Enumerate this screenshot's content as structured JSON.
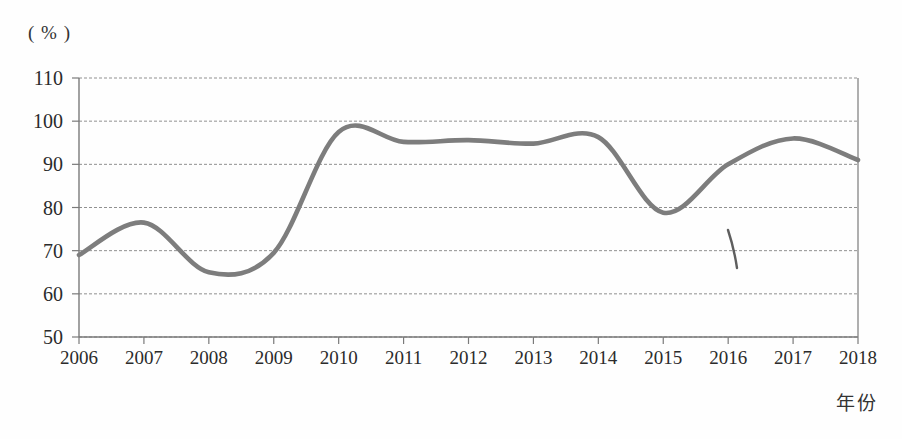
{
  "figure": {
    "unit_label": "( % )",
    "x_axis_title": "年份",
    "background_color": "#fefefe"
  },
  "style": {
    "line_color": "#7d7d7d",
    "grid_color": "#909090",
    "axis_color": "#7a7a7a",
    "text_color": "#2b2b2b"
  },
  "annotations": [
    {
      "name": "pen-stroke-mark",
      "x": 733,
      "y": 248
    }
  ],
  "chart_data": {
    "type": "line",
    "title": "",
    "xlabel": "年份",
    "ylabel": "( % )",
    "categories": [
      "2006",
      "2007",
      "2008",
      "2009",
      "2010",
      "2011",
      "2012",
      "2013",
      "2014",
      "2015",
      "2016",
      "2017",
      "2018"
    ],
    "x": [
      2006,
      2007,
      2008,
      2009,
      2010,
      2011,
      2012,
      2013,
      2014,
      2015,
      2016,
      2017,
      2018
    ],
    "values": [
      69,
      76.5,
      65,
      69.5,
      97.5,
      95.2,
      95.6,
      94.8,
      96.3,
      78.8,
      90,
      96,
      91
    ],
    "series": [
      {
        "name": "比率",
        "values": [
          69,
          76.5,
          65,
          69.5,
          97.5,
          95.2,
          95.6,
          94.8,
          96.3,
          78.8,
          90,
          96,
          91
        ]
      }
    ],
    "ylim": [
      50,
      110
    ],
    "xlim": [
      2006,
      2018
    ],
    "yticks": [
      50,
      60,
      70,
      80,
      90,
      100,
      110
    ],
    "ytick_labels": [
      "50",
      "60",
      "70",
      "80",
      "90",
      "100",
      "110"
    ],
    "xtick_labels": [
      "2006",
      "2007",
      "2008",
      "2009",
      "2010",
      "2011",
      "2012",
      "2013",
      "2014",
      "2015",
      "2016",
      "2017",
      "2018"
    ],
    "grid": true,
    "grid_style": "dashed",
    "legend": false,
    "legend_position": "none",
    "smoothing": "spline"
  },
  "plot_geometry": {
    "left": 79,
    "right": 858,
    "top": 78,
    "bottom": 337
  }
}
